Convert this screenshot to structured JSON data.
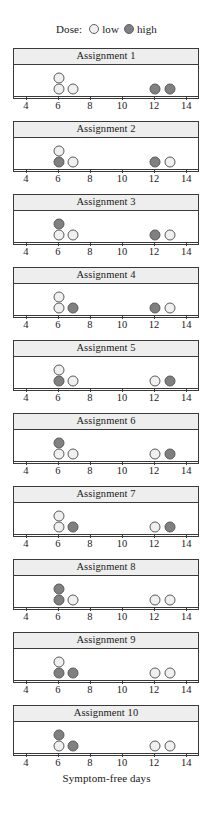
{
  "legend": {
    "title": "Dose:",
    "entries": [
      {
        "label": "low",
        "key": "low",
        "color": "#f0f0f0"
      },
      {
        "label": "high",
        "key": "high",
        "color": "#808080"
      }
    ]
  },
  "axis": {
    "title": "Symptom-free days",
    "ticks": [
      4,
      6,
      8,
      10,
      12,
      14
    ],
    "min": 3.2,
    "max": 14.8
  },
  "chart_data": {
    "type": "scatter",
    "title": "",
    "subtitle": "",
    "xlabel": "Symptom-free days",
    "ylabel": "",
    "xlim": [
      3.2,
      14.8
    ],
    "grid": false,
    "legend_position": "top-center",
    "legend_title": "Dose:",
    "series": [
      {
        "name": "low",
        "color": "#f0f0f0"
      },
      {
        "name": "high",
        "color": "#808080"
      }
    ],
    "panel_labels": [
      "Assignment 1",
      "Assignment 2",
      "Assignment 3",
      "Assignment 4",
      "Assignment 5",
      "Assignment 6",
      "Assignment 7",
      "Assignment 8",
      "Assignment 9",
      "Assignment 10"
    ],
    "panels": [
      {
        "label": "Assignment 1",
        "points": [
          {
            "x": 6,
            "row": 1,
            "dose": "low"
          },
          {
            "x": 6,
            "row": 0,
            "dose": "low"
          },
          {
            "x": 6.85,
            "row": 0,
            "dose": "low"
          },
          {
            "x": 12,
            "row": 0,
            "dose": "high"
          },
          {
            "x": 12.9,
            "row": 0,
            "dose": "high"
          }
        ]
      },
      {
        "label": "Assignment 2",
        "points": [
          {
            "x": 6,
            "row": 1,
            "dose": "low"
          },
          {
            "x": 6,
            "row": 0,
            "dose": "high"
          },
          {
            "x": 6.85,
            "row": 0,
            "dose": "low"
          },
          {
            "x": 12,
            "row": 0,
            "dose": "high"
          },
          {
            "x": 12.9,
            "row": 0,
            "dose": "low"
          }
        ]
      },
      {
        "label": "Assignment 3",
        "points": [
          {
            "x": 6,
            "row": 1,
            "dose": "high"
          },
          {
            "x": 6,
            "row": 0,
            "dose": "low"
          },
          {
            "x": 6.85,
            "row": 0,
            "dose": "low"
          },
          {
            "x": 12,
            "row": 0,
            "dose": "high"
          },
          {
            "x": 12.9,
            "row": 0,
            "dose": "low"
          }
        ]
      },
      {
        "label": "Assignment 4",
        "points": [
          {
            "x": 6,
            "row": 1,
            "dose": "low"
          },
          {
            "x": 6,
            "row": 0,
            "dose": "low"
          },
          {
            "x": 6.85,
            "row": 0,
            "dose": "high"
          },
          {
            "x": 12,
            "row": 0,
            "dose": "high"
          },
          {
            "x": 12.9,
            "row": 0,
            "dose": "low"
          }
        ]
      },
      {
        "label": "Assignment 5",
        "points": [
          {
            "x": 6,
            "row": 1,
            "dose": "low"
          },
          {
            "x": 6,
            "row": 0,
            "dose": "high"
          },
          {
            "x": 6.85,
            "row": 0,
            "dose": "low"
          },
          {
            "x": 12,
            "row": 0,
            "dose": "low"
          },
          {
            "x": 12.9,
            "row": 0,
            "dose": "high"
          }
        ]
      },
      {
        "label": "Assignment 6",
        "points": [
          {
            "x": 6,
            "row": 1,
            "dose": "high"
          },
          {
            "x": 6,
            "row": 0,
            "dose": "low"
          },
          {
            "x": 6.85,
            "row": 0,
            "dose": "low"
          },
          {
            "x": 12,
            "row": 0,
            "dose": "low"
          },
          {
            "x": 12.9,
            "row": 0,
            "dose": "high"
          }
        ]
      },
      {
        "label": "Assignment 7",
        "points": [
          {
            "x": 6,
            "row": 1,
            "dose": "low"
          },
          {
            "x": 6,
            "row": 0,
            "dose": "low"
          },
          {
            "x": 6.85,
            "row": 0,
            "dose": "high"
          },
          {
            "x": 12,
            "row": 0,
            "dose": "low"
          },
          {
            "x": 12.9,
            "row": 0,
            "dose": "high"
          }
        ]
      },
      {
        "label": "Assignment 8",
        "points": [
          {
            "x": 6,
            "row": 1,
            "dose": "high"
          },
          {
            "x": 6,
            "row": 0,
            "dose": "high"
          },
          {
            "x": 6.85,
            "row": 0,
            "dose": "low"
          },
          {
            "x": 12,
            "row": 0,
            "dose": "low"
          },
          {
            "x": 12.9,
            "row": 0,
            "dose": "low"
          }
        ]
      },
      {
        "label": "Assignment 9",
        "points": [
          {
            "x": 6,
            "row": 1,
            "dose": "low"
          },
          {
            "x": 6,
            "row": 0,
            "dose": "high"
          },
          {
            "x": 6.85,
            "row": 0,
            "dose": "high"
          },
          {
            "x": 12,
            "row": 0,
            "dose": "low"
          },
          {
            "x": 12.9,
            "row": 0,
            "dose": "low"
          }
        ]
      },
      {
        "label": "Assignment 10",
        "points": [
          {
            "x": 6,
            "row": 1,
            "dose": "high"
          },
          {
            "x": 6,
            "row": 0,
            "dose": "low"
          },
          {
            "x": 6.85,
            "row": 0,
            "dose": "high"
          },
          {
            "x": 12,
            "row": 0,
            "dose": "low"
          },
          {
            "x": 12.9,
            "row": 0,
            "dose": "low"
          }
        ]
      }
    ]
  },
  "layout": {
    "panel_tops": [
      48,
      121,
      194,
      267,
      340,
      413,
      486,
      559,
      632,
      705
    ],
    "axis_tops": [
      96,
      169,
      242,
      315,
      388,
      461,
      534,
      607,
      680,
      753
    ],
    "axis_title_top": 772
  }
}
